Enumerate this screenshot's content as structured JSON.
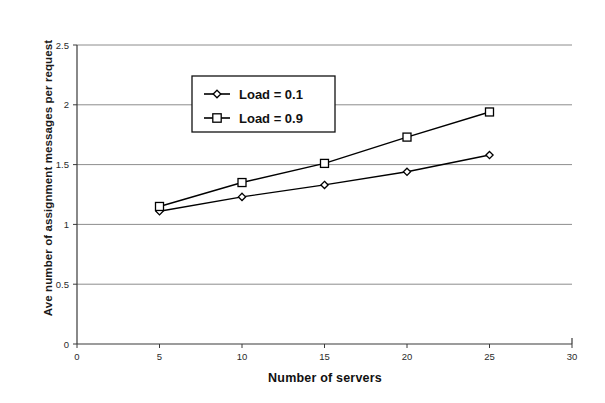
{
  "chart_data": {
    "type": "line",
    "title": "",
    "xlabel": "Number of servers",
    "ylabel": "Ave number of assignment messages per request",
    "xlim": [
      0,
      30
    ],
    "ylim": [
      0,
      2.5
    ],
    "xticks": [
      "0",
      "5",
      "10",
      "15",
      "20",
      "25",
      "30"
    ],
    "xtick_values": [
      0,
      5,
      10,
      15,
      20,
      25,
      30
    ],
    "yticks": [
      "0",
      "0.5",
      "1",
      "1.5",
      "2",
      "2.5"
    ],
    "ytick_values": [
      0,
      0.5,
      1,
      1.5,
      2,
      2.5
    ],
    "grid": "horizontal",
    "legend_position": "upper-center",
    "x": [
      5,
      10,
      15,
      20,
      25
    ],
    "series": [
      {
        "name": "Load = 0.1",
        "marker": "diamond",
        "values": [
          1.11,
          1.23,
          1.33,
          1.44,
          1.58
        ]
      },
      {
        "name": "Load = 0.9",
        "marker": "square",
        "values": [
          1.15,
          1.35,
          1.51,
          1.73,
          1.94
        ]
      }
    ],
    "colors": {
      "line": "#000000",
      "grid": "#808080",
      "axis": "#3a3a3a",
      "background": "#ffffff"
    }
  },
  "legend": {
    "entries": [
      {
        "label": "Load = 0.1"
      },
      {
        "label": "Load = 0.9"
      }
    ]
  },
  "axes": {
    "x_title": "Number of servers",
    "y_title": "Ave number of assignment messages per request"
  }
}
